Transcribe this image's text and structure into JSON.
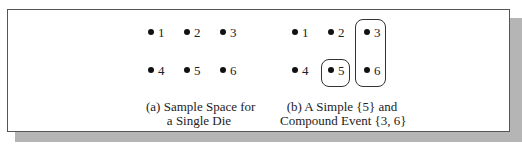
{
  "panel_a": {
    "points": [
      {
        "label": "1"
      },
      {
        "label": "2"
      },
      {
        "label": "3"
      },
      {
        "label": "4"
      },
      {
        "label": "5"
      },
      {
        "label": "6"
      }
    ],
    "caption_line1": "(a) Sample Space for",
    "caption_line2": "a Single Die"
  },
  "panel_b": {
    "points": [
      {
        "label": "1"
      },
      {
        "label": "2"
      },
      {
        "label": "3"
      },
      {
        "label": "4"
      },
      {
        "label": "5"
      },
      {
        "label": "6"
      }
    ],
    "simple_event": "{5}",
    "compound_event": "{3, 6}",
    "caption_line1": "(b) A Simple {5} and",
    "caption_line2": "Compound Event {3, 6}"
  }
}
